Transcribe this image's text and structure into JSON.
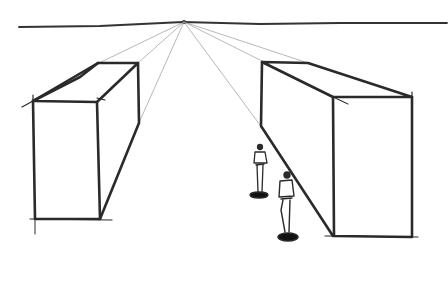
{
  "image": {
    "description": "Hand-drawn one-point perspective sketch: horizon line with a single vanishing point, two rectangular box buildings on either side, and two small human figures standing in the street between them.",
    "colors": {
      "ink": "#2a2a2a",
      "guide": "#9a9a9a",
      "background": "#ffffff"
    },
    "elements": [
      "horizon-line",
      "vanishing-point",
      "left-box",
      "right-box",
      "perspective-guides",
      "figure-near",
      "figure-far"
    ]
  }
}
